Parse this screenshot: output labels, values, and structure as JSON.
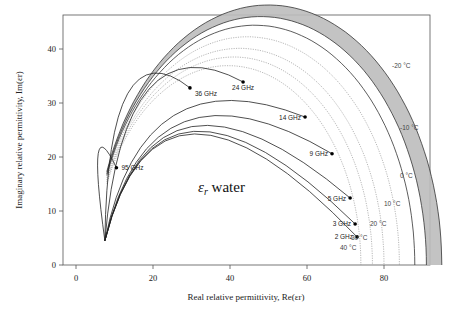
{
  "chart_data": {
    "type": "line",
    "title": "",
    "xlabel": "Real relative permittivity,  Re(εr)",
    "ylabel": "Imaginary relative permittivity,  Im(εr)",
    "xlim": [
      -3,
      92
    ],
    "ylim": [
      0,
      46
    ],
    "xticks": [
      0,
      20,
      40,
      60,
      80
    ],
    "yticks": [
      0,
      10,
      20,
      30,
      40
    ],
    "grid": false,
    "annotation": {
      "symbol": "ε",
      "subscript": "r",
      "text": " water"
    },
    "shaded_band": {
      "description": "ice / supercooled range between -20 °C and -10 °C",
      "color": "#bdbdbd"
    },
    "temperature_labels": [
      "-20 °C",
      "-10 °C",
      "0 °C",
      "10 °C",
      "20 °C",
      "30 °C",
      "40 °C"
    ],
    "temperature_curves": [
      {
        "name": "-20 °C",
        "style": "solid",
        "eps_s": 95,
        "eps_inf": 5.0,
        "radius_scale": 1.0
      },
      {
        "name": "-10 °C",
        "style": "solid",
        "eps_s": 91,
        "eps_inf": 5.0,
        "radius_scale": 1.0
      },
      {
        "name": "0 °C",
        "style": "solid",
        "eps_s": 88,
        "eps_inf": 5.0,
        "radius_scale": 1.0
      },
      {
        "name": "10 °C",
        "style": "dotted",
        "eps_s": 84,
        "eps_inf": 5.0,
        "radius_scale": 1.0
      },
      {
        "name": "20 °C",
        "style": "dotted",
        "eps_s": 80,
        "eps_inf": 5.0,
        "radius_scale": 1.0
      },
      {
        "name": "30 °C",
        "style": "dotted",
        "eps_s": 77,
        "eps_inf": 5.0,
        "radius_scale": 1.0
      },
      {
        "name": "40 °C",
        "style": "dotted",
        "eps_s": 74,
        "eps_inf": 5.0,
        "radius_scale": 1.0
      }
    ],
    "series": [
      {
        "name": "frequency points",
        "points": [
          {
            "label": "95 GHz",
            "re": 10.5,
            "im": 18.0
          },
          {
            "label": "36 GHz",
            "re": 29.6,
            "im": 32.8
          },
          {
            "label": "24 GHz",
            "re": 43.4,
            "im": 33.9
          },
          {
            "label": "14 GHz",
            "re": 59.5,
            "im": 27.4
          },
          {
            "label": "9 GHz",
            "re": 66.5,
            "im": 20.6
          },
          {
            "label": "5 GHz",
            "re": 71.2,
            "im": 12.4
          },
          {
            "label": "3 GHz",
            "re": 72.5,
            "im": 7.6
          },
          {
            "label": "2 GHz",
            "re": 73.0,
            "im": 5.2
          }
        ]
      }
    ],
    "frequency_arcs": [
      {
        "label": "95 GHz",
        "from": "-10 °C"
      },
      {
        "label": "36 GHz",
        "from": "-10 °C"
      },
      {
        "label": "24 GHz",
        "from": "-10 °C"
      },
      {
        "label": "14 GHz",
        "from": "-10 °C"
      },
      {
        "label": "9 GHz",
        "from": "-10 °C"
      },
      {
        "label": "5 GHz",
        "from": "-10 °C"
      },
      {
        "label": "3 GHz",
        "from": "-10 °C"
      },
      {
        "label": "2 GHz",
        "from": "-10 °C"
      }
    ]
  }
}
